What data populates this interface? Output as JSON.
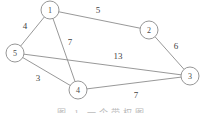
{
  "figure": {
    "type": "undirected-weighted-graph",
    "background_color": "#ffffff",
    "line_color": "#8c8c8c",
    "text_color": "#3f3f3f",
    "caption": "图 1  一个带权图"
  },
  "chart_data": {
    "type": "diagram",
    "title": "",
    "nodes": [
      {
        "id": "1",
        "label": "1",
        "x": 50,
        "y": 10,
        "r": 9
      },
      {
        "id": "2",
        "label": "2",
        "x": 149,
        "y": 30,
        "r": 9
      },
      {
        "id": "3",
        "label": "3",
        "x": 190,
        "y": 76,
        "r": 9
      },
      {
        "id": "4",
        "label": "4",
        "x": 78,
        "y": 90,
        "r": 9
      },
      {
        "id": "5",
        "label": "5",
        "x": 15,
        "y": 53,
        "r": 9
      }
    ],
    "edges": [
      {
        "source": "1",
        "target": "2",
        "weight": 5,
        "label": "5",
        "lx": 98,
        "ly": 10
      },
      {
        "source": "1",
        "target": "5",
        "weight": 4,
        "label": "4",
        "lx": 25,
        "ly": 26
      },
      {
        "source": "1",
        "target": "4",
        "weight": 7,
        "label": "7",
        "lx": 70,
        "ly": 42
      },
      {
        "source": "2",
        "target": "3",
        "weight": 6,
        "label": "6",
        "lx": 176,
        "ly": 46
      },
      {
        "source": "5",
        "target": "3",
        "weight": 13,
        "label": "13",
        "lx": 118,
        "ly": 56
      },
      {
        "source": "5",
        "target": "4",
        "weight": 3,
        "label": "3",
        "lx": 38,
        "ly": 78
      },
      {
        "source": "4",
        "target": "3",
        "weight": 7,
        "label": "7",
        "lx": 136,
        "ly": 95
      }
    ]
  }
}
